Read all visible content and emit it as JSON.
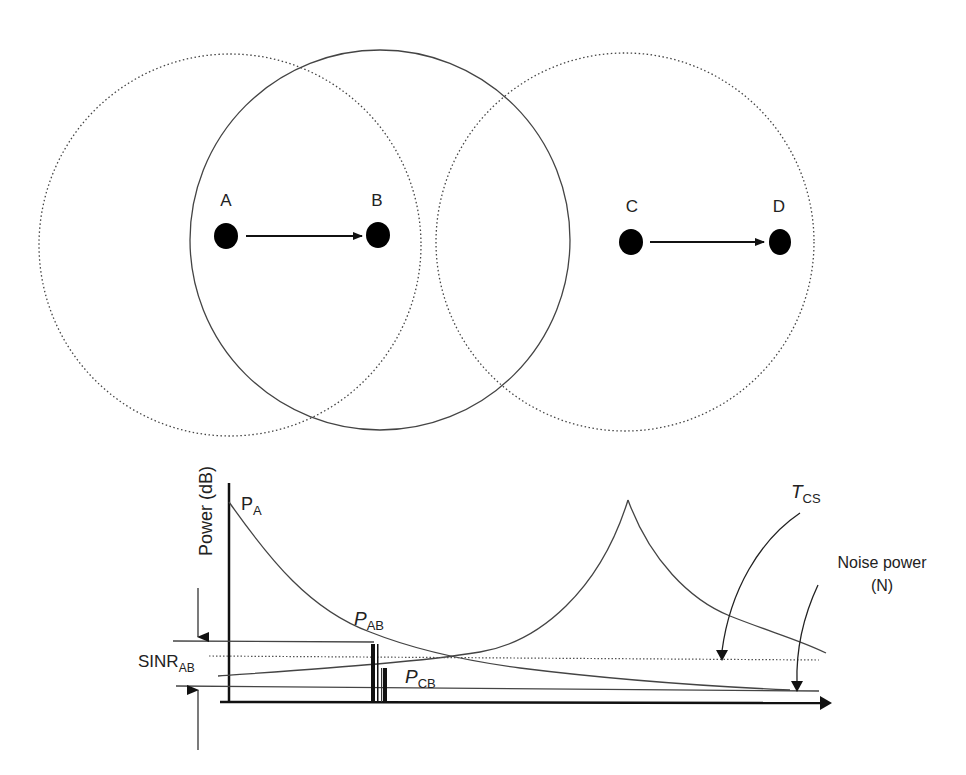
{
  "diagram": {
    "nodes": [
      {
        "id": "A",
        "label": "A"
      },
      {
        "id": "B",
        "label": "B"
      },
      {
        "id": "C",
        "label": "C"
      },
      {
        "id": "D",
        "label": "D"
      }
    ],
    "links": [
      {
        "from": "A",
        "to": "B"
      },
      {
        "from": "C",
        "to": "D"
      }
    ],
    "ranges": [
      {
        "center_node": "A",
        "style": "dotted"
      },
      {
        "center_node": "B",
        "style": "solid"
      },
      {
        "center_node": "C",
        "style": "dotted"
      }
    ]
  },
  "plot": {
    "y_axis_label": "Power (dB)",
    "labels": {
      "pa_main": "P",
      "pa_sub": "A",
      "pab_main": "P",
      "pab_sub": "AB",
      "pcb_main": "P",
      "pcb_sub": "CB",
      "tcs_main": "T",
      "tcs_sub": "CS",
      "sinr_main": "SINR",
      "sinr_sub": "AB",
      "noise_line1": "Noise power",
      "noise_line2": "(N)"
    }
  },
  "colors": {
    "line": "#333333",
    "node": "#000000",
    "background": "#ffffff"
  }
}
